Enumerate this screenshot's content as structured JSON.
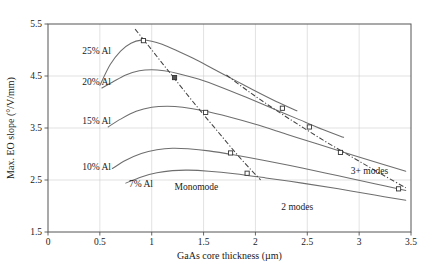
{
  "chart_data": {
    "type": "line",
    "title": "",
    "xlabel": "GaAs core thickness (µm)",
    "ylabel": "Max. EO slope (°/V/mm)",
    "xlim": [
      0,
      3.5
    ],
    "ylim": [
      1.5,
      5.5
    ],
    "xticks": [
      "0",
      "0.5",
      "1",
      "1.5",
      "2",
      "2.5",
      "3",
      "3.5"
    ],
    "xtick_values": [
      0,
      0.5,
      1,
      1.5,
      2,
      2.5,
      3,
      3.5
    ],
    "yticks": [
      "1.5",
      "2.5",
      "3.5",
      "4.5",
      "5.5"
    ],
    "ytick_values": [
      1.5,
      2.5,
      3.5,
      4.5,
      5.5
    ],
    "grid": true,
    "legend_position": "inline-labels",
    "series": [
      {
        "name": "25% Al",
        "label": "25% Al",
        "label_x": 0.33,
        "label_y": 4.92,
        "x": [
          0.5,
          0.6,
          0.7,
          0.8,
          0.9,
          1.0,
          1.1,
          1.25,
          1.4,
          1.6,
          1.8,
          2.0,
          2.2,
          2.4
        ],
        "y": [
          4.32,
          4.72,
          4.98,
          5.13,
          5.19,
          5.17,
          5.11,
          4.98,
          4.84,
          4.63,
          4.42,
          4.21,
          4.01,
          3.83
        ]
      },
      {
        "name": "20% Al",
        "label": "20% Al",
        "label_x": 0.33,
        "label_y": 4.32,
        "x": [
          0.52,
          0.62,
          0.75,
          0.88,
          1.0,
          1.12,
          1.25,
          1.45,
          1.65,
          1.9,
          2.15,
          2.4,
          2.65,
          2.85
        ],
        "y": [
          4.27,
          4.38,
          4.52,
          4.6,
          4.62,
          4.6,
          4.55,
          4.44,
          4.3,
          4.1,
          3.89,
          3.68,
          3.47,
          3.32
        ]
      },
      {
        "name": "15% Al",
        "label": "15% Al",
        "label_x": 0.33,
        "label_y": 3.58,
        "x": [
          0.58,
          0.7,
          0.85,
          1.0,
          1.15,
          1.3,
          1.5,
          1.75,
          2.0,
          2.3,
          2.6,
          2.95,
          3.25,
          3.45
        ],
        "y": [
          3.52,
          3.67,
          3.82,
          3.9,
          3.92,
          3.9,
          3.83,
          3.71,
          3.57,
          3.38,
          3.19,
          2.97,
          2.79,
          2.67
        ]
      },
      {
        "name": "10% Al",
        "label": "10% Al",
        "label_x": 0.33,
        "label_y": 2.7,
        "x": [
          0.62,
          0.75,
          0.9,
          1.05,
          1.2,
          1.35,
          1.55,
          1.8,
          2.1,
          2.45,
          2.8,
          3.15,
          3.45
        ],
        "y": [
          2.72,
          2.88,
          3.01,
          3.08,
          3.11,
          3.1,
          3.06,
          2.98,
          2.87,
          2.73,
          2.58,
          2.43,
          2.3
        ]
      },
      {
        "name": "7% Al",
        "label": "7% Al",
        "label_x": 0.78,
        "label_y": 2.36,
        "x": [
          0.75,
          0.9,
          1.05,
          1.2,
          1.35,
          1.55,
          1.8,
          2.1,
          2.45,
          2.8,
          3.15,
          3.45
        ],
        "y": [
          2.44,
          2.56,
          2.64,
          2.68,
          2.69,
          2.67,
          2.62,
          2.54,
          2.44,
          2.33,
          2.21,
          2.11
        ]
      }
    ],
    "boundaries": [
      {
        "name": "monomode-2modes-boundary",
        "style": "dash-dot",
        "x": [
          0.84,
          0.95,
          1.08,
          1.22,
          1.4,
          1.6,
          1.85,
          2.05
        ],
        "y": [
          5.4,
          5.13,
          4.8,
          4.45,
          4.0,
          3.52,
          2.93,
          2.5
        ]
      },
      {
        "name": "2modes-3plusmodes-boundary",
        "style": "dash-dot",
        "x": [
          1.72,
          1.95,
          2.2,
          2.45,
          2.7,
          2.95,
          3.2,
          3.45
        ],
        "y": [
          4.52,
          4.18,
          3.84,
          3.52,
          3.21,
          2.92,
          2.63,
          2.35
        ]
      }
    ],
    "markers": [
      {
        "x": 0.92,
        "y": 5.18,
        "filled": false
      },
      {
        "x": 1.22,
        "y": 4.47,
        "filled": true
      },
      {
        "x": 1.52,
        "y": 3.8,
        "filled": false
      },
      {
        "x": 1.76,
        "y": 3.02,
        "filled": false
      },
      {
        "x": 1.92,
        "y": 2.63,
        "filled": false
      },
      {
        "x": 2.26,
        "y": 3.88,
        "filled": false
      },
      {
        "x": 2.52,
        "y": 3.52,
        "filled": false
      },
      {
        "x": 2.82,
        "y": 3.03,
        "filled": false
      },
      {
        "x": 3.38,
        "y": 2.33,
        "filled": false
      }
    ],
    "annotations": [
      {
        "name": "monomode-region-label",
        "text": "Monomode",
        "x": 1.22,
        "y": 2.3
      },
      {
        "name": "two-modes-region-label",
        "text": "2 modes",
        "x": 2.25,
        "y": 1.92
      },
      {
        "name": "three-plus-modes-region-label",
        "text": "3+ modes",
        "x": 2.92,
        "y": 2.62
      }
    ],
    "colors": {
      "curve": "#6e6e6e",
      "boundary": "#444444",
      "grid": "#cfcfcf",
      "frame": "#555555",
      "text": "#1a1a1a",
      "background": "#ffffff"
    }
  }
}
